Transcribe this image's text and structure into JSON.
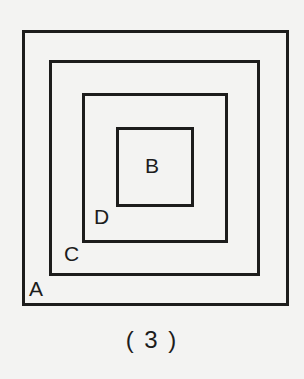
{
  "figure": {
    "caption": "( 3 )",
    "colors": {
      "background": "#f3f3f2",
      "stroke": "#1c1c1c"
    },
    "rectangles": [
      {
        "id": "A",
        "label": "A",
        "left": 22,
        "top": 30,
        "width": 267,
        "height": 276
      },
      {
        "id": "C",
        "label": "C",
        "left": 49,
        "top": 60,
        "width": 211,
        "height": 216
      },
      {
        "id": "D",
        "label": "D",
        "left": 82,
        "top": 93,
        "width": 146,
        "height": 150
      },
      {
        "id": "B",
        "label": "B",
        "left": 116,
        "top": 127,
        "width": 78,
        "height": 80
      }
    ],
    "labels": {
      "A": "A",
      "B": "B",
      "C": "C",
      "D": "D"
    }
  }
}
